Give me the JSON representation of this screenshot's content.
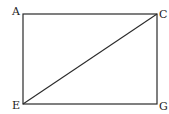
{
  "diagram": {
    "type": "rectangle-with-diagonal",
    "stroke_color": "#2a2a2a",
    "background": "#ffffff",
    "vertices": {
      "A": {
        "label": "A",
        "x": 23,
        "y": 14
      },
      "C": {
        "label": "C",
        "x": 157,
        "y": 14
      },
      "E": {
        "label": "E",
        "x": 23,
        "y": 104
      },
      "G": {
        "label": "G",
        "x": 157,
        "y": 104
      }
    },
    "segments": [
      [
        "A",
        "C"
      ],
      [
        "C",
        "G"
      ],
      [
        "G",
        "E"
      ],
      [
        "E",
        "A"
      ],
      [
        "E",
        "C"
      ]
    ]
  }
}
